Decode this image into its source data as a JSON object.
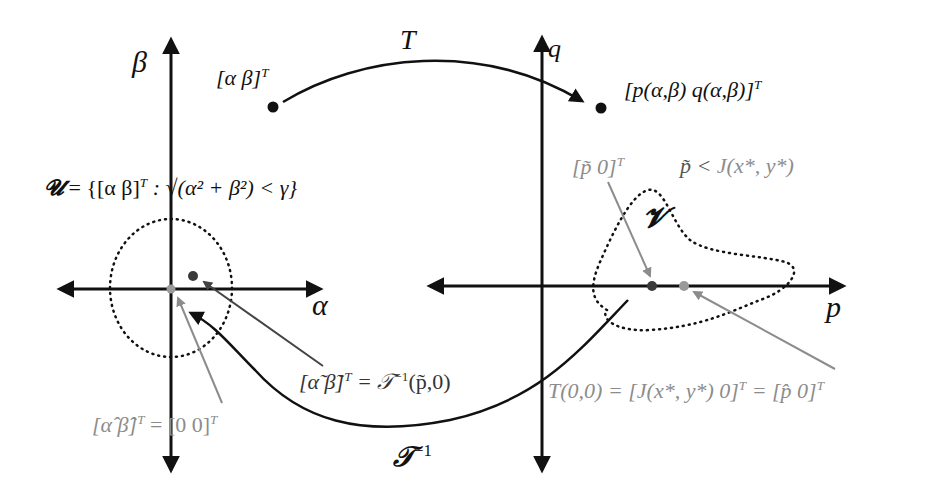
{
  "diagram": {
    "left_plane": {
      "vertical_axis_label": "β",
      "horizontal_axis_label": "α",
      "region_definition": "𝓤 = {[α  β]ᵀ : √(α² + β²) < γ}",
      "region_symbol": "𝓤",
      "region_set": "= {[α  β]",
      "region_set_sup": "T",
      "region_set_cond": ": √(α² + β²) < γ}",
      "point_label": "[α  β]",
      "point_label_sup": "T",
      "origin_label": "[α̂  β̂]",
      "origin_label_sup": "T",
      "origin_label_rhs": "= [0  0]",
      "origin_label_rhs_sup": "T",
      "preimage_label": "[α̃  β̃]",
      "preimage_label_sup": "T",
      "preimage_label_rhs": "= 𝒯",
      "preimage_label_rhs_sup": "−1",
      "preimage_label_args": "(p̃,0)"
    },
    "right_plane": {
      "vertical_axis_label": "q",
      "horizontal_axis_label": "p",
      "region_symbol": "𝓥",
      "image_point_label": "[p(α,β)  q(α,β)]",
      "image_point_label_sup": "T",
      "ptilde_label": "[p̃  0]",
      "ptilde_label_sup": "T",
      "condition_label_lhs": "p̃ <",
      "condition_label_rhs": "J(x*, y*)",
      "t00_label": "T(0,0) = [J(x*, y*)  0]",
      "t00_label_sup": "T",
      "t00_label_rhs": "= [p̂  0]",
      "t00_label_rhs_sup": "T"
    },
    "mappings": {
      "forward_label": "T",
      "inverse_label": "𝒯",
      "inverse_label_sup": "−1"
    },
    "colors": {
      "black": "#111111",
      "gray": "#8c8c8c",
      "dark_dot": "#3a3a3a",
      "gray_dot": "#9a9a9a"
    }
  }
}
